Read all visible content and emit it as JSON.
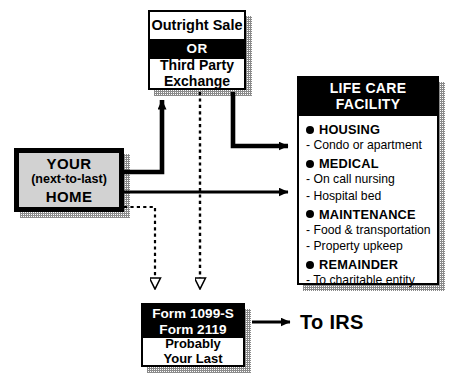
{
  "diagram": {
    "colors": {
      "ink": "#000000",
      "paper": "#ffffff",
      "home_fill": "#d2d2d2",
      "shadow": "#8a8a8a"
    },
    "sale_box": {
      "option_1": "Outright Sale",
      "divider": "OR",
      "option_2_line_1": "Third Party",
      "option_2_line_2": "Exchange"
    },
    "home_box": {
      "line_1": "YOUR",
      "line_2": "(next-to-last)",
      "line_3": "HOME"
    },
    "facility_box": {
      "title_line_1": "LIFE CARE",
      "title_line_2": "FACILITY",
      "items": [
        {
          "heading": "HOUSING",
          "details": [
            "- Condo or apartment"
          ]
        },
        {
          "heading": "MEDICAL",
          "details": [
            "- On call nursing",
            "- Hospital bed"
          ]
        },
        {
          "heading": "MAINTENANCE",
          "details": [
            "- Food & transportation",
            "- Property upkeep"
          ]
        },
        {
          "heading": "REMAINDER",
          "details": [
            "- To charitable entity"
          ]
        }
      ]
    },
    "form_box": {
      "header_line_1": "Form 1099-S",
      "header_line_2": "Form 2119",
      "body_line_1": "Probably",
      "body_line_2": "Your Last"
    },
    "irs_label": "To IRS",
    "connectors": [
      {
        "name": "home-to-sale",
        "style": "solid",
        "arrowhead": "filled"
      },
      {
        "name": "sale-to-facility",
        "style": "solid",
        "arrowhead": "filled"
      },
      {
        "name": "home-to-facility",
        "style": "solid",
        "arrowhead": "filled"
      },
      {
        "name": "home-to-form",
        "style": "dashed",
        "arrowhead": "hollow"
      },
      {
        "name": "sale-to-form",
        "style": "dashed",
        "arrowhead": "hollow"
      },
      {
        "name": "form-to-irs",
        "style": "solid",
        "arrowhead": "filled"
      }
    ]
  }
}
